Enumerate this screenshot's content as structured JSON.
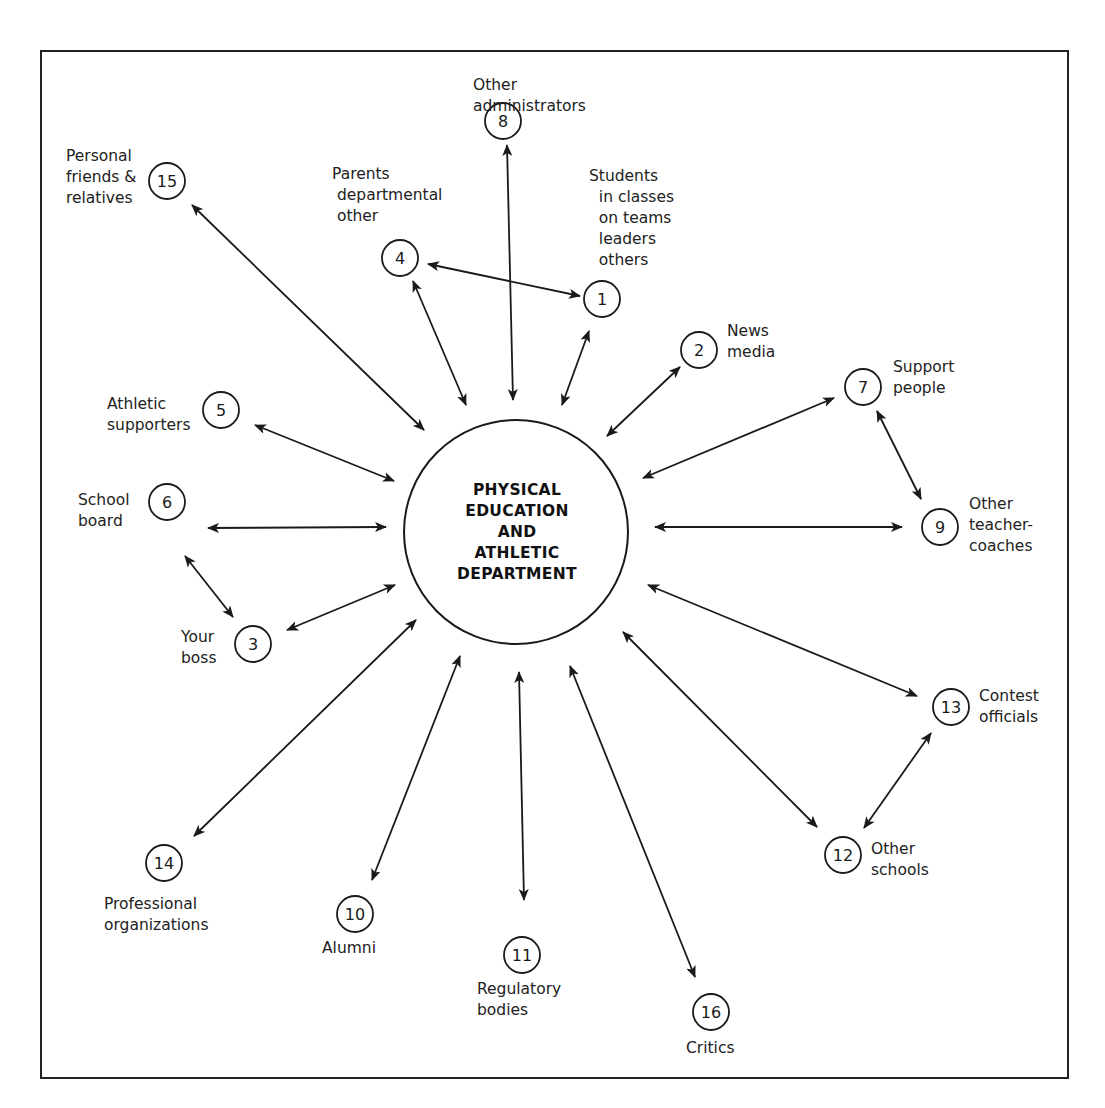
{
  "center": {
    "lines": [
      "PHYSICAL",
      "EDUCATION",
      "AND",
      "ATHLETIC",
      "DEPARTMENT"
    ],
    "cx": 516,
    "cy": 532,
    "r": 112
  },
  "nodes": [
    {
      "id": "1",
      "cx": 602,
      "cy": 299,
      "label": "Students\n  in classes\n  on teams\n  leaders\n  others",
      "lx": 589,
      "ly": 166
    },
    {
      "id": "2",
      "cx": 699,
      "cy": 350,
      "label": "News\nmedia",
      "lx": 727,
      "ly": 321
    },
    {
      "id": "3",
      "cx": 253,
      "cy": 644,
      "label": "Your\nboss",
      "lx": 181,
      "ly": 627
    },
    {
      "id": "4",
      "cx": 400,
      "cy": 258,
      "label": "Parents\n departmental\n other",
      "lx": 332,
      "ly": 164
    },
    {
      "id": "5",
      "cx": 221,
      "cy": 410,
      "label": "Athletic\nsupporters",
      "lx": 107,
      "ly": 394
    },
    {
      "id": "6",
      "cx": 167,
      "cy": 502,
      "label": "School\nboard",
      "lx": 78,
      "ly": 512,
      "label_top": 511
    },
    {
      "id": "7",
      "cx": 863,
      "cy": 387,
      "label": "Support\npeople",
      "lx": 893,
      "ly": 357
    },
    {
      "id": "8",
      "cx": 503,
      "cy": 121,
      "label": "Other\nadministrators",
      "lx": 473,
      "ly": 75
    },
    {
      "id": "9",
      "cx": 940,
      "cy": 527,
      "label": "Other\nteacher-\ncoaches",
      "lx": 969,
      "ly": 494
    },
    {
      "id": "10",
      "cx": 355,
      "cy": 914,
      "label": "Alumni",
      "lx": 322,
      "ly": 938
    },
    {
      "id": "11",
      "cx": 522,
      "cy": 955,
      "label": "Regulatory\nbodies",
      "lx": 477,
      "ly": 979
    },
    {
      "id": "12",
      "cx": 843,
      "cy": 855,
      "label": "Other\nschools",
      "lx": 871,
      "ly": 839
    },
    {
      "id": "13",
      "cx": 951,
      "cy": 707,
      "label": "Contest\nofficials",
      "lx": 979,
      "ly": 686
    },
    {
      "id": "14",
      "cx": 164,
      "cy": 863,
      "label": "Professional\norganizations",
      "lx": 104,
      "ly": 894
    },
    {
      "id": "15",
      "cx": 167,
      "cy": 181,
      "label": "Personal\nfriends &\nrelatives",
      "lx": 66,
      "ly": 146
    },
    {
      "id": "16",
      "cx": 711,
      "cy": 1012,
      "label": "Critics",
      "lx": 686,
      "ly": 1038
    }
  ],
  "edges": [
    {
      "from": "15",
      "to": "center",
      "x1": 192,
      "y1": 205,
      "x2": 424,
      "y2": 430
    },
    {
      "from": "8",
      "to": "center",
      "x1": 507,
      "y1": 145,
      "x2": 513,
      "y2": 400
    },
    {
      "from": "4",
      "to": "1",
      "x1": 428,
      "y1": 264,
      "x2": 580,
      "y2": 296
    },
    {
      "from": "4",
      "to": "center",
      "x1": 413,
      "y1": 281,
      "x2": 466,
      "y2": 405
    },
    {
      "from": "1",
      "to": "center",
      "x1": 589,
      "y1": 331,
      "x2": 562,
      "y2": 405
    },
    {
      "from": "2",
      "to": "center",
      "x1": 680,
      "y1": 367,
      "x2": 607,
      "y2": 436
    },
    {
      "from": "7",
      "to": "center",
      "x1": 834,
      "y1": 398,
      "x2": 643,
      "y2": 478
    },
    {
      "from": "7",
      "to": "9",
      "x1": 877,
      "y1": 411,
      "x2": 921,
      "y2": 499
    },
    {
      "from": "9",
      "to": "center",
      "x1": 902,
      "y1": 527,
      "x2": 655,
      "y2": 527
    },
    {
      "from": "5",
      "to": "center",
      "x1": 255,
      "y1": 425,
      "x2": 394,
      "y2": 481
    },
    {
      "from": "6",
      "to": "center",
      "x1": 208,
      "y1": 528,
      "x2": 386,
      "y2": 527
    },
    {
      "from": "6",
      "to": "3",
      "x1": 185,
      "y1": 556,
      "x2": 233,
      "y2": 617
    },
    {
      "from": "3",
      "to": "center",
      "x1": 287,
      "y1": 630,
      "x2": 395,
      "y2": 585
    },
    {
      "from": "14",
      "to": "center",
      "x1": 194,
      "y1": 836,
      "x2": 416,
      "y2": 620
    },
    {
      "from": "10",
      "to": "center",
      "x1": 372,
      "y1": 880,
      "x2": 460,
      "y2": 656
    },
    {
      "from": "11",
      "to": "center",
      "x1": 524,
      "y1": 900,
      "x2": 519,
      "y2": 672
    },
    {
      "from": "16",
      "to": "center",
      "x1": 695,
      "y1": 977,
      "x2": 570,
      "y2": 666
    },
    {
      "from": "12",
      "to": "center",
      "x1": 817,
      "y1": 827,
      "x2": 623,
      "y2": 632
    },
    {
      "from": "13",
      "to": "center",
      "x1": 917,
      "y1": 696,
      "x2": 648,
      "y2": 585
    },
    {
      "from": "13",
      "to": "12",
      "x1": 931,
      "y1": 733,
      "x2": 864,
      "y2": 828
    }
  ],
  "colors": {
    "stroke": "#1a1a1a",
    "background": "#ffffff"
  }
}
